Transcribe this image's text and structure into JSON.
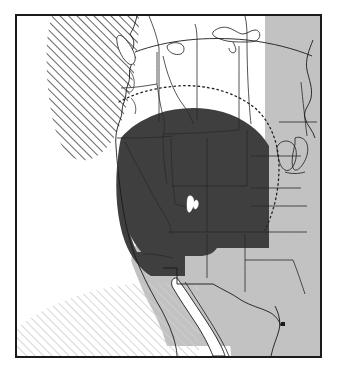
{
  "map": {
    "title": "Western North America distribution map",
    "projection_note": "conic projection with curved parallels",
    "frame": {
      "border_color": "#1a1a1a",
      "border_width_px": 2,
      "background_color": "#ffffff"
    },
    "legend_semantics": {
      "core_range_label": "Core range (dark shading)",
      "secondary_range_label": "Secondary range (light gray shading)",
      "outer_limit_label": "Outer limit (dotted boundary)",
      "ocean_label": "Ocean / out-of-area (diagonal hatching)"
    },
    "colors": {
      "core_fill": "#3f3f3f",
      "secondary_fill": "#c2c2c2",
      "land_fill": "#ffffff",
      "border_line": "#1a1a1a",
      "state_line": "#333333",
      "hatch_dark": "#555555",
      "hatch_light": "#cccccc",
      "lake_fill": "#ffffff",
      "dotted_line": "#222222"
    },
    "regions": [
      {
        "id": "core-range",
        "name": "Core range",
        "fill": "#3f3f3f",
        "description": "Dark shaded area covering Washington, Oregon, Idaho, Montana, Wyoming, Nevada, Utah, Colorado and northern California"
      },
      {
        "id": "secondary-range",
        "name": "Secondary range",
        "fill": "#c2c2c2",
        "description": "Light gray area covering the Great Plains, Southwest, Texas and northern Mexico"
      },
      {
        "id": "ocean-hatch-northwest",
        "name": "Northwest Pacific hatching",
        "fill": "diagonal-hatch-dark",
        "description": "Diagonal hatched area in the upper-left Pacific / Gulf of Alaska"
      },
      {
        "id": "ocean-hatch-southwest",
        "name": "Southwest Pacific hatching",
        "fill": "diagonal-hatch-light",
        "description": "Light diagonal hatched area in the lower-left Pacific"
      },
      {
        "id": "outer-limit-curve",
        "name": "Outer limit",
        "style": "dotted",
        "description": "Dotted arc above the core range across southern Canada and the northern plains"
      }
    ],
    "features": [
      {
        "id": "great-salt-lake",
        "name": "Great Salt Lake",
        "type": "lake"
      },
      {
        "id": "great-lakes",
        "name": "Great Lakes",
        "type": "lake-group"
      },
      {
        "id": "canadian-lakes",
        "name": "Canadian prairie lakes",
        "type": "lake-group"
      },
      {
        "id": "baja-california",
        "name": "Baja California peninsula",
        "type": "peninsula"
      },
      {
        "id": "gulf-of-california",
        "name": "Gulf of California",
        "type": "gulf"
      },
      {
        "id": "vancouver-island",
        "name": "Vancouver Island",
        "type": "island"
      }
    ]
  }
}
